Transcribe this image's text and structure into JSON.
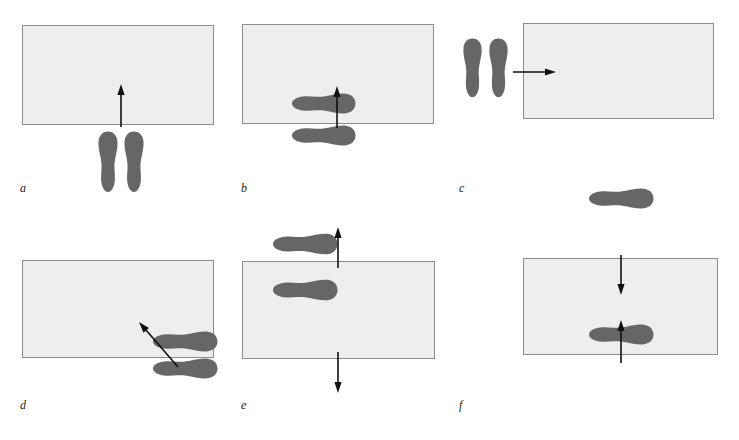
{
  "figure": {
    "width": 739,
    "height": 440,
    "background": "#ffffff",
    "colors": {
      "box_fill": "#eeeeee",
      "box_stroke": "#8c8c8c",
      "foot_fill": "#666666",
      "arrow": "#111111",
      "label_text": "#1a1a1a"
    }
  },
  "panels": [
    {
      "id": "a",
      "label": "a",
      "box": {
        "x": 22,
        "y": 25,
        "w": 192,
        "h": 100
      },
      "feet": [
        {
          "name": "left-foot",
          "orientation": "toes-up",
          "x": 96,
          "y": 131,
          "w": 24,
          "h": 62,
          "mirror": false
        },
        {
          "name": "right-foot",
          "orientation": "toes-up",
          "x": 122,
          "y": 131,
          "w": 24,
          "h": 62,
          "mirror": true
        }
      ],
      "arrows": [
        {
          "name": "approach-arrow",
          "direction": "up",
          "x1": 121,
          "y1": 127,
          "x2": 121,
          "y2": 84
        }
      ]
    },
    {
      "id": "b",
      "label": "b",
      "box": {
        "x": 242,
        "y": 24,
        "w": 192,
        "h": 100
      },
      "feet": [
        {
          "name": "upper-foot",
          "orientation": "toes-right",
          "x": 291,
          "y": 131,
          "w": 65,
          "h": 25,
          "mirror": false
        },
        {
          "name": "lower-foot",
          "orientation": "toes-right",
          "x": 291,
          "y": 163,
          "w": 65,
          "h": 25,
          "mirror": true
        }
      ],
      "arrows": [
        {
          "name": "approach-arrow",
          "direction": "up",
          "x1": 337,
          "y1": 128,
          "x2": 337,
          "y2": 86
        }
      ]
    },
    {
      "id": "c",
      "label": "c",
      "box": {
        "x": 523,
        "y": 23,
        "w": 191,
        "h": 96
      },
      "feet": [
        {
          "name": "left-foot",
          "orientation": "toes-up",
          "x": 461,
          "y": 38,
          "w": 23,
          "h": 60,
          "mirror": false
        },
        {
          "name": "right-foot",
          "orientation": "toes-up",
          "x": 487,
          "y": 38,
          "w": 23,
          "h": 60,
          "mirror": true
        }
      ],
      "arrows": [
        {
          "name": "approach-arrow",
          "direction": "right",
          "x1": 513,
          "y1": 72,
          "x2": 556,
          "y2": 72
        }
      ]
    },
    {
      "id": "d",
      "label": "d",
      "box": {
        "x": 22,
        "y": 260,
        "w": 192,
        "h": 98
      },
      "feet": [
        {
          "name": "upper-foot",
          "orientation": "toes-right",
          "x": 152,
          "y": 370,
          "w": 66,
          "h": 25,
          "mirror": false
        },
        {
          "name": "lower-foot",
          "orientation": "toes-right",
          "x": 152,
          "y": 397,
          "w": 66,
          "h": 25,
          "mirror": true
        }
      ],
      "arrows": [
        {
          "name": "approach-arrow",
          "direction": "up-left",
          "x1": 178,
          "y1": 367,
          "x2": 139,
          "y2": 322
        }
      ]
    },
    {
      "id": "e",
      "label": "e",
      "box": {
        "x": 242,
        "y": 261,
        "w": 193,
        "h": 98
      },
      "feet": [
        {
          "name": "upper-foot",
          "orientation": "toes-right",
          "x": 272,
          "y": 271,
          "w": 66,
          "h": 26,
          "mirror": false
        },
        {
          "name": "lower-foot",
          "orientation": "toes-right",
          "x": 272,
          "y": 317,
          "w": 66,
          "h": 26,
          "mirror": true
        }
      ],
      "arrows": [
        {
          "name": "exit-arrow-up",
          "direction": "up",
          "x1": 338,
          "y1": 268,
          "x2": 338,
          "y2": 227
        },
        {
          "name": "exit-arrow-down",
          "direction": "down",
          "x1": 338,
          "y1": 352,
          "x2": 338,
          "y2": 393
        }
      ]
    },
    {
      "id": "f",
      "label": "f",
      "box": {
        "x": 523,
        "y": 258,
        "w": 195,
        "h": 97
      },
      "feet": [
        {
          "name": "upper-foot",
          "orientation": "toes-right",
          "x": 588,
          "y": 227,
          "w": 66,
          "h": 25,
          "mirror": false
        },
        {
          "name": "lower-foot",
          "orientation": "toes-right",
          "x": 588,
          "y": 363,
          "w": 66,
          "h": 25,
          "mirror": true
        }
      ],
      "arrows": [
        {
          "name": "approach-arrow-down",
          "direction": "down",
          "x1": 621,
          "y1": 255,
          "x2": 621,
          "y2": 295
        },
        {
          "name": "approach-arrow-up",
          "direction": "up",
          "x1": 621,
          "y1": 363,
          "x2": 621,
          "y2": 320
        }
      ]
    }
  ],
  "labels": {
    "a": {
      "text": "a",
      "x": 20,
      "y": 182
    },
    "b": {
      "text": "b",
      "x": 241,
      "y": 182
    },
    "c": {
      "text": "c",
      "x": 459,
      "y": 182
    },
    "d": {
      "text": "d",
      "x": 20,
      "y": 399
    },
    "e": {
      "text": "e",
      "x": 241,
      "y": 399
    },
    "f": {
      "text": "f",
      "x": 459,
      "y": 399
    }
  }
}
